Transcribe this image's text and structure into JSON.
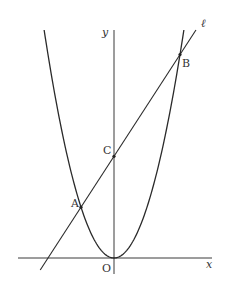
{
  "figure": {
    "type": "coordinate-geometry",
    "axes": {
      "x_label": "x",
      "y_label": "y",
      "origin_label": "O"
    },
    "curve": {
      "name": "parabola",
      "equation_form": "y = ax^2",
      "vertex": "O"
    },
    "line": {
      "label": "ℓ"
    },
    "points": {
      "A": {
        "label": "A",
        "x": -1
      },
      "B": {
        "label": "B",
        "x": 2
      },
      "C": {
        "label": "C",
        "on": "y-axis"
      }
    }
  },
  "render": {
    "origin_px": [
      114,
      258
    ],
    "unit_px": 33,
    "k_px": 0.0467,
    "x_axis_px": [
      18,
      212
    ],
    "y_axis_px": [
      30,
      274
    ],
    "parabola_top_y_px": 30,
    "line_px": {
      "start": [
        42,
        270
      ],
      "end": [
        201,
        30
      ]
    },
    "colors": {
      "ink": "#2a2a2a",
      "axis": "#3a3a3a",
      "background": "#ffffff"
    }
  }
}
